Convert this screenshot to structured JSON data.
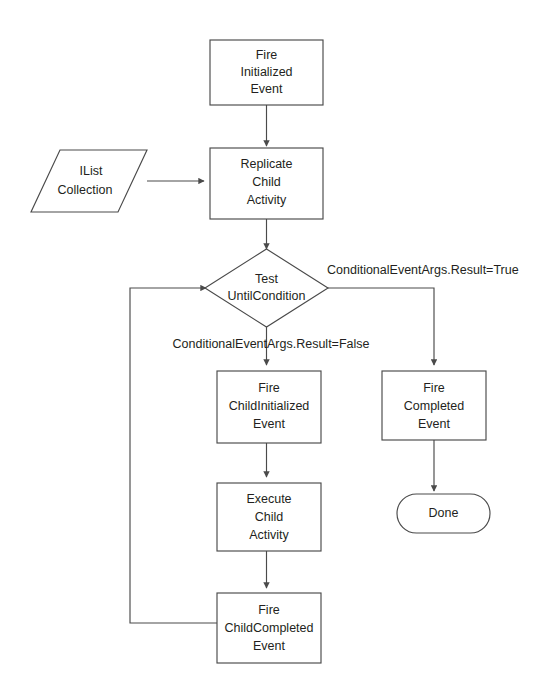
{
  "diagram": {
    "background_color": "#ffffff",
    "line_color": "#4a4a4a",
    "text_color": "#231f20",
    "nodes": {
      "fire_initialized": {
        "shape": "rectangle",
        "lines": [
          "Fire",
          "Initialized",
          "Event"
        ]
      },
      "ilist_collection": {
        "shape": "parallelogram",
        "lines": [
          "IList",
          "Collection"
        ]
      },
      "replicate_child": {
        "shape": "rectangle",
        "lines": [
          "Replicate",
          "Child",
          "Activity"
        ]
      },
      "test_until_condition": {
        "shape": "diamond",
        "lines": [
          "Test",
          "UntilCondition"
        ]
      },
      "fire_child_initialized": {
        "shape": "rectangle",
        "lines": [
          "Fire",
          "ChildInitialized",
          "Event"
        ]
      },
      "execute_child": {
        "shape": "rectangle",
        "lines": [
          "Execute",
          "Child",
          "Activity"
        ]
      },
      "fire_child_completed": {
        "shape": "rectangle",
        "lines": [
          "Fire",
          "ChildCompleted",
          "Event"
        ]
      },
      "fire_completed": {
        "shape": "rectangle",
        "lines": [
          "Fire",
          "Completed",
          "Event"
        ]
      },
      "done": {
        "shape": "terminator",
        "lines": [
          "Done"
        ]
      }
    },
    "edge_labels": {
      "result_true": "ConditionalEventArgs.Result=True",
      "result_false": "ConditionalEventArgs.Result=False"
    }
  }
}
